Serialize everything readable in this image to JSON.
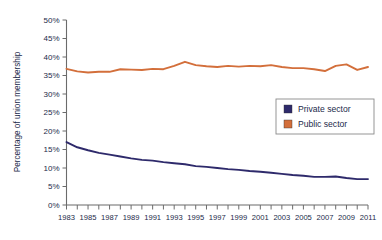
{
  "chart_data": {
    "type": "line",
    "title": "",
    "xlabel": "",
    "ylabel": "Percentage of union membership",
    "xlim": [
      1983,
      2011
    ],
    "ylim": [
      0,
      50
    ],
    "grid": false,
    "legend_position": "top-right",
    "x": [
      1983,
      1984,
      1985,
      1986,
      1987,
      1988,
      1989,
      1990,
      1991,
      1992,
      1993,
      1994,
      1995,
      1996,
      1997,
      1998,
      1999,
      2000,
      2001,
      2002,
      2003,
      2004,
      2005,
      2006,
      2007,
      2008,
      2009,
      2010,
      2011
    ],
    "x_tick_labels": [
      "1983",
      "1985",
      "1987",
      "1989",
      "1991",
      "1993",
      "1995",
      "1997",
      "1999",
      "2001",
      "2003",
      "2005",
      "2007",
      "2009",
      "2011"
    ],
    "y_tick_labels": [
      "0%",
      "5%",
      "10%",
      "15%",
      "20%",
      "25%",
      "30%",
      "35%",
      "40%",
      "45%",
      "50%"
    ],
    "y_ticks": [
      0,
      5,
      10,
      15,
      20,
      25,
      30,
      35,
      40,
      45,
      50
    ],
    "series": [
      {
        "name": "Private sector",
        "color": "#2e2a6b",
        "values": [
          17.0,
          15.6,
          14.8,
          14.1,
          13.6,
          13.1,
          12.6,
          12.2,
          12.0,
          11.6,
          11.3,
          11.0,
          10.5,
          10.3,
          10.0,
          9.7,
          9.5,
          9.2,
          9.0,
          8.7,
          8.4,
          8.1,
          7.9,
          7.6,
          7.6,
          7.7,
          7.3,
          7.0,
          7.0
        ]
      },
      {
        "name": "Public sector",
        "color": "#d36f3b",
        "values": [
          36.8,
          36.1,
          35.8,
          36.0,
          36.0,
          36.7,
          36.6,
          36.5,
          36.8,
          36.7,
          37.6,
          38.7,
          37.8,
          37.5,
          37.3,
          37.6,
          37.4,
          37.6,
          37.5,
          37.8,
          37.3,
          37.0,
          37.0,
          36.7,
          36.2,
          37.6,
          38.0,
          36.5,
          37.3
        ]
      }
    ]
  },
  "legend": {
    "items": [
      {
        "label": "Private sector",
        "color": "#2e2a6b"
      },
      {
        "label": "Public sector",
        "color": "#d36f3b"
      }
    ]
  },
  "axis": {
    "y_title": "Percentage of union membership"
  }
}
